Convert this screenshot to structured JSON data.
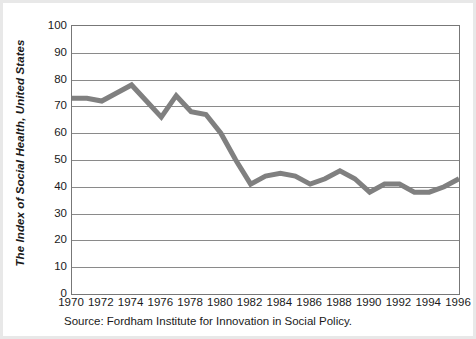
{
  "chart_data": {
    "type": "line",
    "title": "",
    "xlabel": "",
    "ylabel": "The Index of Social Health, United States",
    "source": "Source: Fordham Institute for Innovation in Social Policy.",
    "xlim": [
      1970,
      1996
    ],
    "ylim": [
      0,
      100
    ],
    "ytick_values": [
      100,
      90,
      80,
      70,
      60,
      50,
      40,
      30,
      20,
      10,
      0
    ],
    "ytick_labels": [
      "100",
      "90",
      "80",
      "70",
      "60",
      "50",
      "40",
      "30",
      "20",
      "10",
      "0"
    ],
    "xtick_values": [
      1970,
      1972,
      1974,
      1976,
      1978,
      1980,
      1982,
      1984,
      1986,
      1988,
      1990,
      1992,
      1994,
      1996
    ],
    "xtick_labels": [
      "1970",
      "1972",
      "1974",
      "1976",
      "1978",
      "1980",
      "1982",
      "1984",
      "1986",
      "1988",
      "1990",
      "1992",
      "1994",
      "1996"
    ],
    "grid": true,
    "legend": "none",
    "line_color": "#808080",
    "line_width": 5,
    "x": [
      1970,
      1971,
      1972,
      1973,
      1974,
      1975,
      1976,
      1977,
      1978,
      1979,
      1980,
      1981,
      1982,
      1983,
      1984,
      1985,
      1986,
      1987,
      1988,
      1989,
      1990,
      1991,
      1992,
      1993,
      1994,
      1995,
      1996
    ],
    "values": [
      73,
      73,
      72,
      75,
      78,
      72,
      66,
      74,
      68,
      67,
      60,
      50,
      41,
      44,
      45,
      44,
      41,
      43,
      46,
      43,
      38,
      41,
      41,
      38,
      38,
      40,
      43
    ],
    "series": [
      {
        "name": "Index of Social Health",
        "values": [
          73,
          73,
          72,
          75,
          78,
          72,
          66,
          74,
          68,
          67,
          60,
          50,
          41,
          44,
          45,
          44,
          41,
          43,
          46,
          43,
          38,
          41,
          41,
          38,
          38,
          40,
          43
        ]
      }
    ]
  }
}
